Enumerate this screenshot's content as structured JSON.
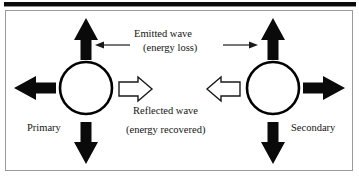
{
  "figure": {
    "colors": {
      "ink": "#000000",
      "frame": "#9a9a9a",
      "background": "#ffffff"
    },
    "labels": {
      "emitted_line1": "Emitted wave",
      "emitted_line2": "(energy loss)",
      "reflected_line1": "Reflected wave",
      "reflected_line2": "(energy recovered)",
      "primary": "Primary",
      "secondary": "Secondary"
    },
    "nodes": [
      {
        "id": "primary",
        "label": "Primary",
        "shape": "circle",
        "fill": "none",
        "stroke": "#000000",
        "cx": 86,
        "cy": 88,
        "r": 26
      },
      {
        "id": "secondary",
        "label": "Secondary",
        "shape": "circle",
        "fill": "none",
        "stroke": "#000000",
        "cx": 273,
        "cy": 88,
        "r": 26
      }
    ],
    "arrows": {
      "solid_block": [
        {
          "id": "primary-up",
          "direction": "up",
          "style": "solid-block"
        },
        {
          "id": "primary-down",
          "direction": "down",
          "style": "solid-block"
        },
        {
          "id": "primary-left",
          "direction": "left",
          "style": "solid-block"
        },
        {
          "id": "secondary-up",
          "direction": "up",
          "style": "solid-block"
        },
        {
          "id": "secondary-down",
          "direction": "down",
          "style": "solid-block"
        },
        {
          "id": "secondary-right",
          "direction": "right",
          "style": "solid-block"
        }
      ],
      "hollow_block": [
        {
          "id": "reflected-right",
          "direction": "right",
          "style": "hollow-block"
        },
        {
          "id": "reflected-left",
          "direction": "left",
          "style": "hollow-block"
        }
      ],
      "thin_line": [
        {
          "id": "emitted-left",
          "direction": "left",
          "style": "thin-line"
        },
        {
          "id": "emitted-right",
          "direction": "right",
          "style": "thin-line"
        }
      ]
    }
  }
}
